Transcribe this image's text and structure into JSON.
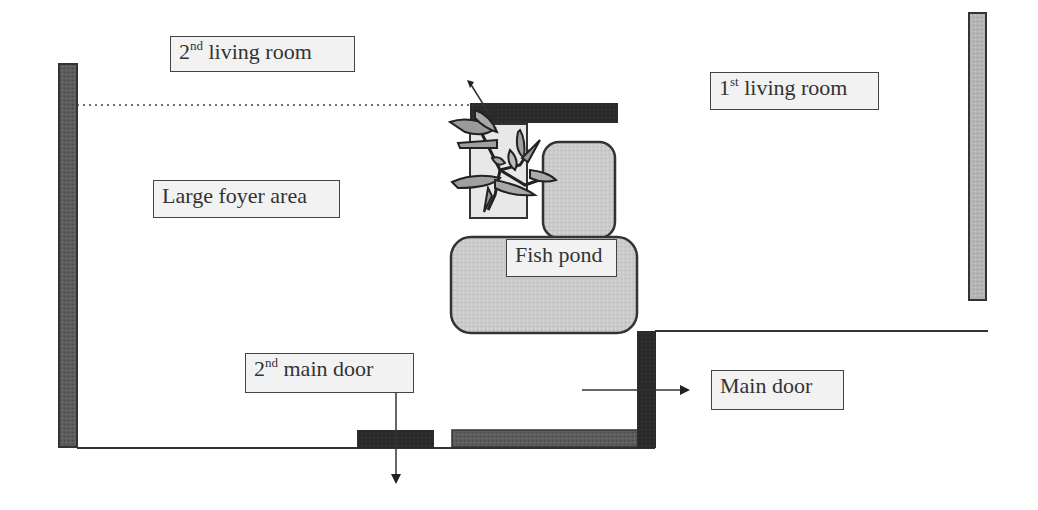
{
  "diagram": {
    "type": "floor-plan",
    "colors": {
      "background": "#ffffff",
      "dark_wall": "#2a2a2a",
      "medium_wall": "#5a5a5a",
      "light_wall": "#b0b0b0",
      "pond_fill": "#c8c8c8",
      "label_fill": "#f2f2f2",
      "line": "#333333"
    },
    "labels": {
      "second_living_room": {
        "num": "2",
        "sup": "nd",
        "text": " living room"
      },
      "first_living_room": {
        "num": "1",
        "sup": "st",
        "text": " living room"
      },
      "large_foyer_area": {
        "text": "Large foyer area"
      },
      "fish_pond": {
        "text": "Fish pond"
      },
      "second_main_door": {
        "num": "2",
        "sup": "nd",
        "text": " main door"
      },
      "main_door": {
        "text": "Main door"
      }
    },
    "icons": {
      "plant": "potted-plant-icon",
      "arrow_down": "arrow-down-icon",
      "arrow_right": "arrow-right-icon"
    }
  }
}
